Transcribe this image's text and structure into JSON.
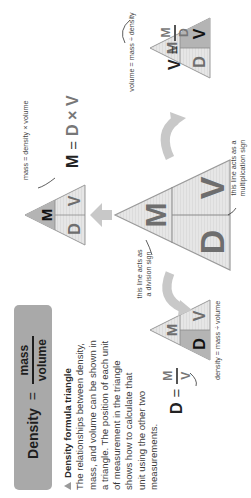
{
  "header": {
    "left": "Density",
    "equals": "=",
    "numerator": "mass",
    "denominator": "volume"
  },
  "caption": {
    "title": "Density formula triangle",
    "lines": [
      "The relationships between density,",
      "mass, and volume can be shown in",
      "a triangle. The position of each unit",
      "of measurement in the triangle",
      "shows how to calculate that",
      "unit using the other two",
      "measurements."
    ]
  },
  "triangles": {
    "main": {
      "top": "M",
      "bottom_left": "D",
      "bottom_right": "V"
    },
    "mass": {
      "top": "M",
      "bottom_left": "D",
      "bottom_right": "V",
      "highlight": "M"
    },
    "density": {
      "top": "M",
      "bottom_left": "D",
      "bottom_right": "V",
      "highlight": "D"
    },
    "volume": {
      "top": "M",
      "bottom_left": "D",
      "bottom_right": "V",
      "highlight": "V"
    }
  },
  "formulas": {
    "mass": {
      "lhs": "M",
      "eq": "=",
      "rhs": "D × V",
      "note": "mass = density × volume"
    },
    "density": {
      "lhs": "D",
      "eq": "=",
      "num": "M",
      "den": "V",
      "note": "density = mass ÷ volume"
    },
    "volume": {
      "lhs": "V",
      "eq": "=",
      "num": "M",
      "den": "D",
      "note": "volume = mass ÷ density"
    }
  },
  "annotations": {
    "division": [
      "this line acts as",
      "a division sign"
    ],
    "multiplication": [
      "this line acts as a",
      "multiplication sign"
    ]
  },
  "colors": {
    "triangle_fill": "#e4e4e4",
    "triangle_highlight": "#b4b4b4",
    "triangle_stroke": "#9a9a9a",
    "header_bg": "#a9a9a9",
    "arrow": "#c8c8c8"
  }
}
